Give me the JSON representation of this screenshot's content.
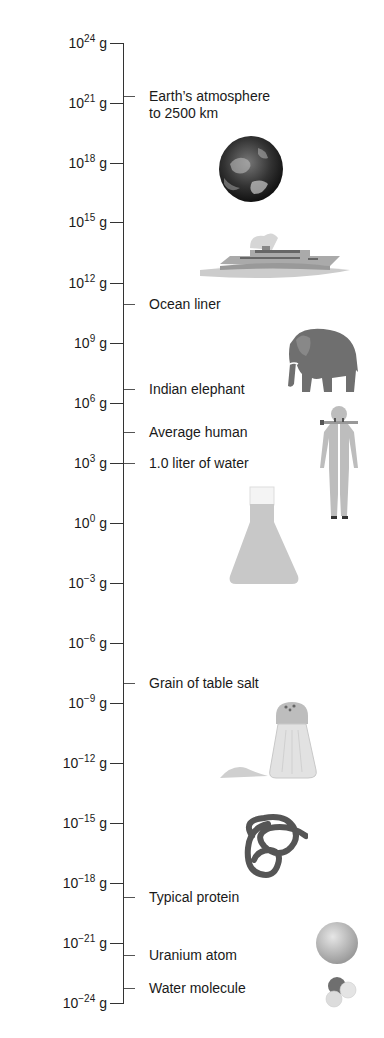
{
  "title": "",
  "unit": "g",
  "scale": [
    {
      "base": "10",
      "exp": "24",
      "y": 43
    },
    {
      "base": "10",
      "exp": "21",
      "y": 103
    },
    {
      "base": "10",
      "exp": "18",
      "y": 163
    },
    {
      "base": "10",
      "exp": "15",
      "y": 222
    },
    {
      "base": "10",
      "exp": "12",
      "y": 283
    },
    {
      "base": "10",
      "exp": "9",
      "y": 343
    },
    {
      "base": "10",
      "exp": "6",
      "y": 403
    },
    {
      "base": "10",
      "exp": "3",
      "y": 463
    },
    {
      "base": "10",
      "exp": "0",
      "y": 523
    },
    {
      "base": "10",
      "exp": "−3",
      "y": 583
    },
    {
      "base": "10",
      "exp": "−6",
      "y": 643
    },
    {
      "base": "10",
      "exp": "−9",
      "y": 703
    },
    {
      "base": "10",
      "exp": "−12",
      "y": 763
    },
    {
      "base": "10",
      "exp": "−15",
      "y": 823
    },
    {
      "base": "10",
      "exp": "−18",
      "y": 883
    },
    {
      "base": "10",
      "exp": "−21",
      "y": 943
    },
    {
      "base": "10",
      "exp": "−24",
      "y": 1003
    }
  ],
  "objects": [
    {
      "label_line1": "Earth’s atmosphere",
      "label_line2": "to 2500 km",
      "y": 96,
      "icon": "earth-icon"
    },
    {
      "label_line1": "Ocean liner",
      "y": 304,
      "icon": "ship-icon"
    },
    {
      "label_line1": "Indian elephant",
      "y": 389,
      "icon": "elephant-icon"
    },
    {
      "label_line1": "Average human",
      "y": 432,
      "icon": "human-icon"
    },
    {
      "label_line1": "1.0 liter of water",
      "y": 463,
      "icon": "flask-icon"
    },
    {
      "label_line1": "Grain of table salt",
      "y": 683,
      "icon": "salt-shaker-icon"
    },
    {
      "label_line1": "Typical protein",
      "y": 897,
      "icon": "protein-icon"
    },
    {
      "label_line1": "Uranium atom",
      "y": 955,
      "icon": "atom-icon"
    },
    {
      "label_line1": "Water molecule",
      "y": 988,
      "icon": "water-molecule-icon"
    }
  ],
  "chart_data": {
    "type": "table",
    "axis": {
      "unit": "g",
      "ticks": [
        "10^24",
        "10^21",
        "10^18",
        "10^15",
        "10^12",
        "10^9",
        "10^6",
        "10^3",
        "10^0",
        "10^-3",
        "10^-6",
        "10^-9",
        "10^-12",
        "10^-15",
        "10^-18",
        "10^-21",
        "10^-24"
      ]
    },
    "items": [
      {
        "name": "Earth’s atmosphere to 2500 km",
        "approx_log10_g": 21.5
      },
      {
        "name": "Ocean liner",
        "approx_log10_g": 11
      },
      {
        "name": "Indian elephant",
        "approx_log10_g": 6.7
      },
      {
        "name": "Average human",
        "approx_log10_g": 4.8
      },
      {
        "name": "1.0 liter of water",
        "approx_log10_g": 3
      },
      {
        "name": "Grain of table salt",
        "approx_log10_g": -8
      },
      {
        "name": "Typical protein",
        "approx_log10_g": -18.7
      },
      {
        "name": "Uranium atom",
        "approx_log10_g": -21.6
      },
      {
        "name": "Water molecule",
        "approx_log10_g": -23.3
      }
    ]
  }
}
